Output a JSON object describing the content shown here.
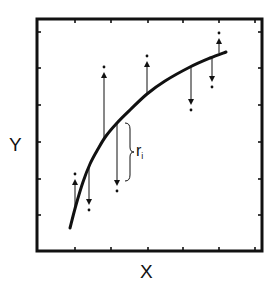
{
  "figure": {
    "type": "residual-diagram",
    "x_axis_label": "X",
    "y_axis_label": "Y",
    "residual_label": "r",
    "residual_subscript": "i",
    "colors": {
      "ink": "#111111",
      "background": "#ffffff"
    },
    "frame": {
      "left": 37,
      "top": 19,
      "right": 262,
      "bottom": 251
    },
    "ticks": {
      "x": [
        75,
        111,
        148,
        183,
        219,
        255
      ],
      "y": [
        32,
        68,
        105,
        142,
        179,
        215
      ]
    },
    "curve_points": [
      [
        70,
        228
      ],
      [
        76,
        205
      ],
      [
        83,
        182
      ],
      [
        90,
        164
      ],
      [
        98,
        149
      ],
      [
        106,
        136
      ],
      [
        117,
        123
      ],
      [
        130,
        110
      ],
      [
        147,
        94
      ],
      [
        165,
        81
      ],
      [
        190,
        67
      ],
      [
        210,
        58
      ],
      [
        226,
        52
      ]
    ],
    "residuals": [
      {
        "x": 75,
        "curve_y": 210,
        "point_y": 175,
        "direction": "up"
      },
      {
        "x": 89,
        "curve_y": 166,
        "point_y": 209,
        "direction": "down"
      },
      {
        "x": 104,
        "curve_y": 138,
        "point_y": 68,
        "direction": "up"
      },
      {
        "x": 117,
        "curve_y": 123,
        "point_y": 190,
        "direction": "down"
      },
      {
        "x": 147,
        "curve_y": 93,
        "point_y": 57,
        "direction": "up"
      },
      {
        "x": 191,
        "curve_y": 66,
        "point_y": 109,
        "direction": "down"
      },
      {
        "x": 212,
        "curve_y": 57,
        "point_y": 86,
        "direction": "down"
      },
      {
        "x": 219,
        "curve_y": 53,
        "point_y": 34,
        "direction": "up"
      }
    ],
    "brace": {
      "x": 128,
      "top": 123,
      "bottom": 181
    }
  }
}
